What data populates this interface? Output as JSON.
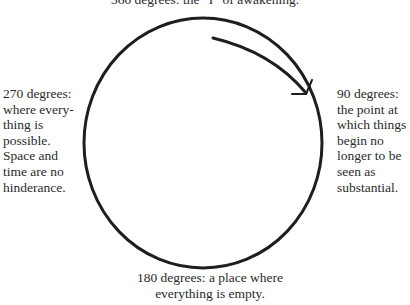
{
  "diagram": {
    "labels": {
      "top": "360 degrees: the “I” of awakening.",
      "right": "90 degrees: the point at which things begin no longer to be seen as substantial.",
      "bottom": "180 degrees: a place where everything is empty.",
      "left": "270 degrees: where every-thing is possible. Space and time are no hinderance."
    },
    "direction": "clockwise",
    "colors": {
      "stroke": "#1e1e1e",
      "text": "#2b2b2b",
      "background": "#ffffff"
    }
  }
}
